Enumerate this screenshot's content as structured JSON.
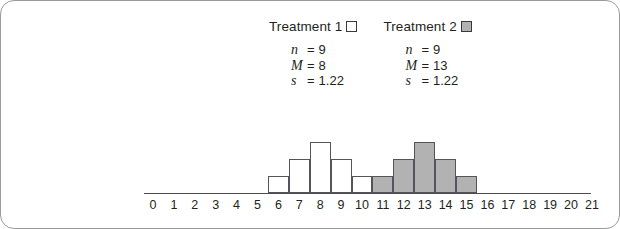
{
  "legend": {
    "groups": [
      {
        "label": "Treatment 1",
        "swatch": "open-square-swatch",
        "swatch_fill": "#ffffff",
        "stats": [
          {
            "symbol": "n",
            "eq": "=",
            "value": "9"
          },
          {
            "symbol": "M",
            "eq": "=",
            "value": "8"
          },
          {
            "symbol": "s",
            "eq": "=",
            "value": "1.22"
          }
        ]
      },
      {
        "label": "Treatment 2",
        "swatch": "filled-square-swatch",
        "swatch_fill": "#b2b2b2",
        "stats": [
          {
            "symbol": "n",
            "eq": "=",
            "value": "9"
          },
          {
            "symbol": "M",
            "eq": "=",
            "value": "13"
          },
          {
            "symbol": "s",
            "eq": "=",
            "value": "1.22"
          }
        ]
      }
    ]
  },
  "chart_data": {
    "type": "bar",
    "title": "",
    "xlabel": "",
    "ylabel": "",
    "grid": false,
    "legend_position": "top-center",
    "x": [
      0,
      1,
      2,
      3,
      4,
      5,
      6,
      7,
      8,
      9,
      10,
      11,
      12,
      13,
      14,
      15,
      16,
      17,
      18,
      19,
      20,
      21
    ],
    "xticklabels": [
      "0",
      "1",
      "2",
      "3",
      "4",
      "5",
      "6",
      "7",
      "8",
      "9",
      "10",
      "11",
      "12",
      "13",
      "14",
      "15",
      "16",
      "17",
      "18",
      "19",
      "20",
      "21"
    ],
    "xlim": [
      0,
      21
    ],
    "ylim": [
      0,
      3
    ],
    "series": [
      {
        "name": "Treatment 1",
        "color": "#ffffff",
        "edgecolor": "#53555a",
        "points": [
          {
            "x": 6,
            "y": 1
          },
          {
            "x": 7,
            "y": 2
          },
          {
            "x": 8,
            "y": 3
          },
          {
            "x": 9,
            "y": 2
          },
          {
            "x": 10,
            "y": 1
          }
        ]
      },
      {
        "name": "Treatment 2",
        "color": "#b2b2b2",
        "edgecolor": "#53555a",
        "points": [
          {
            "x": 11,
            "y": 1
          },
          {
            "x": 12,
            "y": 2
          },
          {
            "x": 13,
            "y": 3
          },
          {
            "x": 14,
            "y": 2
          },
          {
            "x": 15,
            "y": 1
          }
        ]
      }
    ]
  },
  "colors": {
    "card_border": "#9a9a9a",
    "axis": "#4d4d4d",
    "text": "#231f20",
    "bar_gray": "#b2b2b2",
    "bar_edge": "#53555a"
  }
}
